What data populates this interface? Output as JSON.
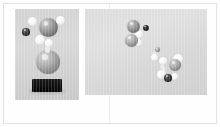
{
  "figure": {
    "background_color": "#fdfdfd",
    "border_color": "#e2e2e2",
    "spine_color": "#eeeeee",
    "caption_left": "",
    "caption_right": ""
  },
  "panels": [
    {
      "id": "panel-left",
      "name": "left-photo-panel",
      "background_color": "#d4d4d4",
      "x": 15,
      "y": 9,
      "width": 64,
      "height": 91,
      "description": "Vertical molecular model on black pedestal",
      "pedestal": {
        "color": "#0c0c0c",
        "x": 17,
        "y": 70,
        "width": 30,
        "height": 13
      },
      "atoms": [
        {
          "label": "upper-gray-sphere",
          "type": "gray",
          "x": 24,
          "y": 9,
          "size": 19
        },
        {
          "label": "white-sphere-left",
          "type": "white",
          "x": 13,
          "y": 8,
          "size": 9
        },
        {
          "label": "white-sphere-right",
          "type": "white",
          "x": 41,
          "y": 7,
          "size": 9
        },
        {
          "label": "dark-small-sphere",
          "type": "dark",
          "x": 7,
          "y": 19,
          "size": 8
        },
        {
          "label": "white-sphere-mid",
          "type": "white",
          "x": 20,
          "y": 26,
          "size": 10
        },
        {
          "label": "white-sphere-low",
          "type": "white",
          "x": 30,
          "y": 30,
          "size": 8
        },
        {
          "label": "lower-gray-sphere",
          "type": "midgray",
          "x": 21,
          "y": 41,
          "size": 24
        }
      ],
      "bonds": [
        {
          "label": "bond-upper-lower",
          "x": 30,
          "y": 34,
          "width": 5,
          "height": 10,
          "angle": 0
        }
      ]
    },
    {
      "id": "panel-right",
      "name": "right-photo-panel",
      "background_color": "#dcdcdc",
      "x": 85,
      "y": 9,
      "width": 122,
      "height": 86,
      "description": "Scattered molecular clusters on light background",
      "atoms": [
        {
          "label": "cluster-a-gray-top",
          "type": "gray",
          "x": 42,
          "y": 11,
          "size": 13
        },
        {
          "label": "cluster-a-black-dot",
          "type": "black",
          "x": 58,
          "y": 16,
          "size": 6
        },
        {
          "label": "cluster-a-white",
          "type": "white",
          "x": 49,
          "y": 21,
          "size": 9
        },
        {
          "label": "cluster-a-gray-bot",
          "type": "midgray",
          "x": 40,
          "y": 25,
          "size": 13
        },
        {
          "label": "cluster-a-white-bot",
          "type": "white",
          "x": 50,
          "y": 30,
          "size": 7
        },
        {
          "label": "mid-small-gray",
          "type": "midgray",
          "x": 70,
          "y": 38,
          "size": 5
        },
        {
          "label": "mid-white-tail",
          "type": "white",
          "x": 66,
          "y": 45,
          "size": 7
        },
        {
          "label": "cluster-b-white-up",
          "type": "white",
          "x": 74,
          "y": 48,
          "size": 8
        },
        {
          "label": "cluster-b-gray",
          "type": "midgray",
          "x": 84,
          "y": 50,
          "size": 12
        },
        {
          "label": "cluster-b-white-big",
          "type": "white",
          "x": 88,
          "y": 45,
          "size": 10
        },
        {
          "label": "cluster-b-white-low",
          "type": "white",
          "x": 72,
          "y": 61,
          "size": 9
        },
        {
          "label": "cluster-b-dark-low",
          "type": "dark",
          "x": 79,
          "y": 65,
          "size": 8
        },
        {
          "label": "cluster-b-white-end",
          "type": "white",
          "x": 86,
          "y": 64,
          "size": 7
        }
      ],
      "bonds": [
        {
          "label": "bond-mid-1",
          "x": 67,
          "y": 42,
          "width": 4,
          "height": 7,
          "angle": 20
        },
        {
          "label": "bond-mid-2",
          "x": 76,
          "y": 55,
          "width": 4,
          "height": 8,
          "angle": -25
        }
      ]
    }
  ]
}
